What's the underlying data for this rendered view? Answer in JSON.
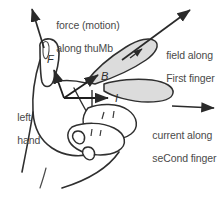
{
  "diagram": {
    "background_color": "#ffffff",
    "ink_color": "#3b3b3b",
    "shade_color": "#dcdcdc",
    "labels": {
      "force_line1": "force (motion)",
      "force_line2": "along thuMb",
      "field_line1": "field along",
      "field_line2": "First finger",
      "current_line1": "current along",
      "current_line2": "seCond finger",
      "hand_line1": "left",
      "hand_line2": "hand"
    },
    "vector_symbols": {
      "force": "F",
      "field": "B",
      "current": "I"
    }
  }
}
